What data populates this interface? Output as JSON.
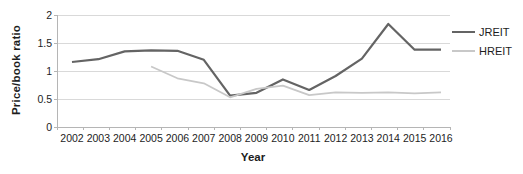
{
  "chart_data": {
    "type": "line",
    "title": "",
    "xlabel": "Year",
    "ylabel": "Price/book ratio",
    "categories": [
      "2002",
      "2003",
      "2004",
      "2005",
      "2006",
      "2007",
      "2008",
      "2009",
      "2010",
      "2011",
      "2012",
      "2013",
      "2014",
      "2015",
      "2016"
    ],
    "series": [
      {
        "name": "JREIT",
        "color": "#646464",
        "values": [
          1.16,
          1.21,
          1.35,
          1.37,
          1.36,
          1.2,
          0.56,
          0.61,
          0.85,
          0.66,
          0.91,
          1.22,
          1.84,
          1.38,
          1.38
        ]
      },
      {
        "name": "HREIT",
        "color": "#c8c8c8",
        "values": [
          null,
          null,
          null,
          1.08,
          0.87,
          0.78,
          0.53,
          0.68,
          0.74,
          0.57,
          0.62,
          0.61,
          0.62,
          0.6,
          0.62
        ]
      }
    ],
    "yticks": [
      0,
      0.5,
      1,
      1.5,
      2
    ],
    "ylim": [
      0,
      2
    ],
    "grid": true,
    "legend_position": "right",
    "colors": {
      "gridline": "#d9d9d9",
      "axis": "#b5b5b5",
      "text": "#1d1d1d",
      "background": "#ffffff"
    }
  }
}
